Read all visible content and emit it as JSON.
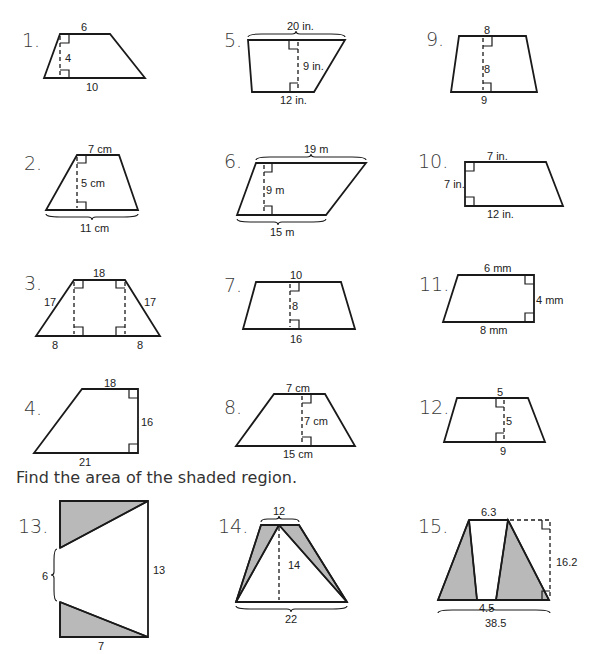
{
  "instruction": "Find the area of the shaded region.",
  "problems": [
    {
      "number": "1.",
      "labels": {
        "top": "6",
        "height": "4",
        "bottom": "10"
      }
    },
    {
      "number": "2.",
      "labels": {
        "top": "7 cm",
        "height": "5 cm",
        "bottom": "11 cm"
      }
    },
    {
      "number": "3.",
      "labels": {
        "top": "18",
        "left_side": "17",
        "right_side": "17",
        "bottom_left": "8",
        "bottom_right": "8"
      }
    },
    {
      "number": "4.",
      "labels": {
        "top": "18",
        "height": "16",
        "bottom": "21"
      }
    },
    {
      "number": "5.",
      "labels": {
        "top": "20 in.",
        "height": "9 in.",
        "bottom": "12 in."
      }
    },
    {
      "number": "6.",
      "labels": {
        "top": "19 m",
        "height": "9 m",
        "bottom": "15 m"
      }
    },
    {
      "number": "7.",
      "labels": {
        "top": "10",
        "height": "8",
        "bottom": "16"
      }
    },
    {
      "number": "8.",
      "labels": {
        "top": "7 cm",
        "height": "7 cm",
        "bottom": "15 cm"
      }
    },
    {
      "number": "9.",
      "labels": {
        "top": "8",
        "height": "8",
        "bottom": "9"
      }
    },
    {
      "number": "10.",
      "labels": {
        "top": "7 in.",
        "height": "7 in.",
        "bottom": "12 in."
      }
    },
    {
      "number": "11.",
      "labels": {
        "top": "6 mm",
        "height": "4 mm",
        "bottom": "8 mm"
      }
    },
    {
      "number": "12.",
      "labels": {
        "top": "5",
        "height": "5",
        "bottom": "9"
      }
    },
    {
      "number": "13.",
      "labels": {
        "gap": "6",
        "height": "13",
        "bottom": "7"
      }
    },
    {
      "number": "14.",
      "labels": {
        "top": "12",
        "height": "14",
        "bottom": "22"
      }
    },
    {
      "number": "15.",
      "labels": {
        "top": "6.3",
        "height": "16.2",
        "gap": "4.5",
        "bottom": "38.5"
      }
    }
  ],
  "colors": {
    "shade": "#b9b9b9",
    "line": "#1a1a1a",
    "background": "#ffffff"
  }
}
